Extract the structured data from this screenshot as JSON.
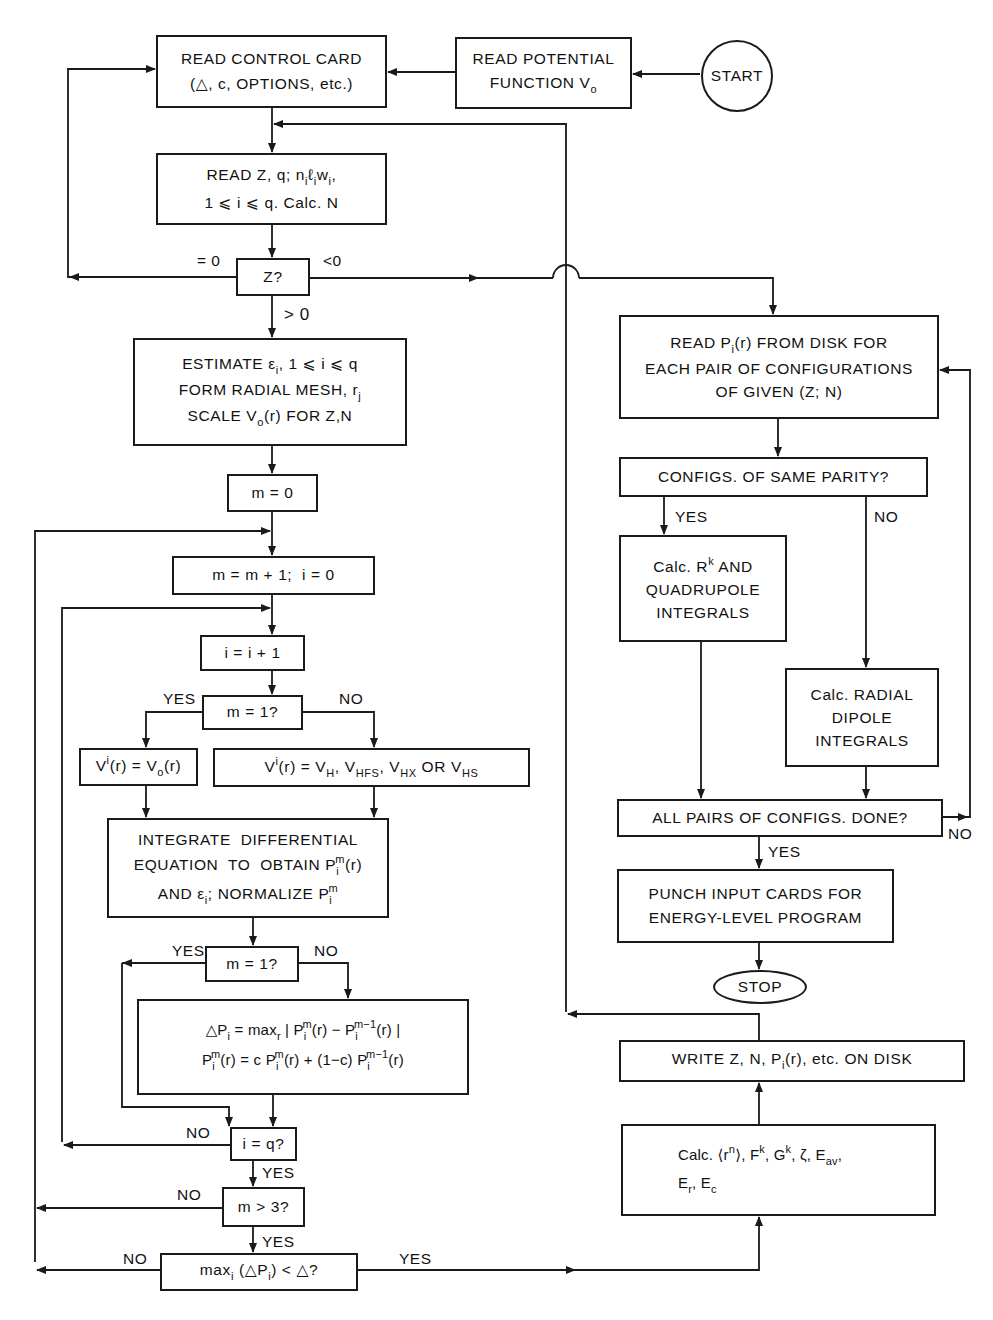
{
  "diagram": {
    "type": "flowchart",
    "nodes": {
      "start": {
        "label": "START"
      },
      "read_potential": {
        "line1": "READ POTENTIAL",
        "line2": "FUNCTION V",
        "line2_sub": "o"
      },
      "read_control": {
        "line1": "READ CONTROL CARD",
        "line2": "(△, c, OPTIONS, etc.)"
      },
      "read_z": {
        "line1_a": "READ Z, q; n",
        "line1_b": "ℓ",
        "line1_c": "w",
        "line1_d": ",",
        "sub_i": "i",
        "line2": "1 ⩽ i ⩽ q. Calc. N"
      },
      "z_decision": {
        "label": "Z?"
      },
      "estimate": {
        "line1_a": "ESTIMATE ε",
        "line1_b": ", 1 ⩽ i ⩽ q",
        "line2_a": "FORM  RADIAL  MESH, r",
        "line2_sub": "j",
        "line3_a": "SCALE V",
        "line3_sub": "o",
        "line3_b": "(r) FOR  Z,N"
      },
      "m_zero": {
        "label": "m = 0"
      },
      "m_increment": {
        "label": "m = m + 1;  i = 0"
      },
      "i_increment": {
        "label": "i = i + 1"
      },
      "m_one_a": {
        "label": "m = 1?"
      },
      "v_initial": {
        "a": "V",
        "sup": "i",
        "b": "(r) = V",
        "sub": "o",
        "c": "(r)"
      },
      "v_options": {
        "a": "V",
        "sup": "i",
        "b": "(r) = V",
        "sub1": "H",
        "c": ", V",
        "sub2": "HFS",
        "d": ", V",
        "sub3": "HX",
        "e": " OR V",
        "sub4": "HS"
      },
      "integrate": {
        "line1": "INTEGRATE  DIFFERENTIAL",
        "line2_a": "EQUATION  TO  OBTAIN P",
        "line2_sub": "i",
        "line2_sup": "m",
        "line2_b": "(r)",
        "line3_a": "AND ε",
        "line3_sub": "i",
        "line3_b": "; NORMALIZE P",
        "line3_sub2": "i",
        "line3_sup": "m"
      },
      "m_one_b": {
        "label": "m = 1?"
      },
      "delta_p": {
        "line1_a": "△P",
        "line1_sub": "i",
        "line1_b": " = max",
        "line1_sub2": "r",
        "line1_c": " | P",
        "line1_sub3": "i",
        "line1_sup": "m",
        "line1_d": "(r) − P",
        "line1_sub4": "i",
        "line1_sup2": "m−1",
        "line1_e": "(r) |",
        "line2_a": "P",
        "line2_sub": "i",
        "line2_sup": "m",
        "line2_b": "(r) = c P",
        "line2_sub2": "i",
        "line2_sup2": "m",
        "line2_c": "(r) + (1−c) P",
        "line2_sub3": "i",
        "line2_sup3": "m−1",
        "line2_d": "(r)"
      },
      "i_eq_q": {
        "label": "i = q?"
      },
      "m_gt_3": {
        "label": "m > 3?"
      },
      "convergence": {
        "a": "max",
        "sub": "i",
        "b": " (△P",
        "sub2": "i",
        "c": ") < △?"
      },
      "read_pi": {
        "line1_a": "READ P",
        "line1_sub": "i",
        "line1_b": "(r) FROM DISK FOR",
        "line2": "EACH PAIR OF CONFIGURATIONS",
        "line3": "OF GIVEN (Z; N)"
      },
      "same_parity": {
        "label": "CONFIGS. OF SAME PARITY?"
      },
      "calc_rk": {
        "line1_a": "Calc. R",
        "line1_sup": "k",
        "line1_b": " AND",
        "line2": "QUADRUPOLE",
        "line3": "INTEGRALS"
      },
      "calc_dipole": {
        "line1": "Calc. RADIAL",
        "line2": "DIPOLE",
        "line3": "INTEGRALS"
      },
      "all_pairs": {
        "label": "ALL PAIRS OF CONFIGS. DONE?"
      },
      "punch": {
        "line1": "PUNCH INPUT CARDS FOR",
        "line2": "ENERGY-LEVEL PROGRAM"
      },
      "stop": {
        "label": "STOP"
      },
      "write_disk": {
        "a": "WRITE Z, N, P",
        "sub": "i",
        "b": "(r), etc. ON DISK"
      },
      "calc_params": {
        "line1_a": "Calc. ⟨r",
        "line1_sup": "n",
        "line1_b": "⟩, F",
        "line1_sup2": "k",
        "line1_c": ", G",
        "line1_sup3": "k",
        "line1_d": ", ζ, E",
        "line1_sub": "av",
        "line1_e": ",",
        "line2_a": "E",
        "line2_sub": "r",
        "line2_b": ", E",
        "line2_sub2": "c"
      }
    },
    "edge_labels": {
      "z_eq_0": "= 0",
      "z_lt_0": "<0",
      "z_gt_0": "> 0",
      "m1a_yes": "YES",
      "m1a_no": "NO",
      "m1b_yes": "YES",
      "m1b_no": "NO",
      "iq_no": "NO",
      "iq_yes": "YES",
      "m3_no": "NO",
      "m3_yes": "YES",
      "conv_no": "NO",
      "conv_yes": "YES",
      "parity_yes": "YES",
      "parity_no": "NO",
      "pairs_yes": "YES",
      "pairs_no": "NO"
    },
    "line_color": "#1a1a1a",
    "background": "#ffffff"
  }
}
